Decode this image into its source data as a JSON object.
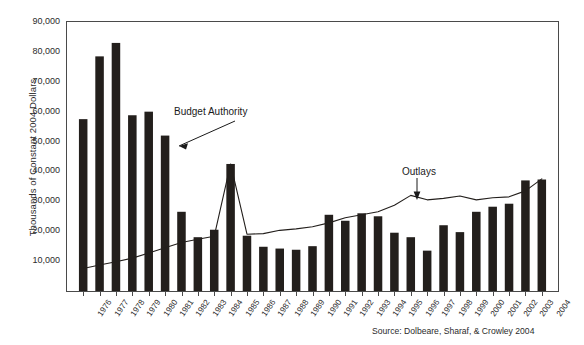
{
  "chart_data": {
    "type": "bar",
    "title": "",
    "subtitle": "",
    "xlabel": "",
    "ylabel": "Thousands of Constant 2004 Dollars",
    "ylim": [
      0,
      90000
    ],
    "ytick_labels": [
      "90,000",
      "80,000",
      "70,000",
      "60,000",
      "50,000",
      "40,000",
      "30,000",
      "20,000",
      "10,000"
    ],
    "ytick_values": [
      90000,
      80000,
      70000,
      60000,
      50000,
      40000,
      30000,
      20000,
      10000
    ],
    "grid": false,
    "legend_position": "none",
    "categories": [
      "1976",
      "1977",
      "1978",
      "1979",
      "1980",
      "1981",
      "1982",
      "1983",
      "1984",
      "1985",
      "1986",
      "1987",
      "1988",
      "1989",
      "1990",
      "1991",
      "1992",
      "1993",
      "1994",
      "1995",
      "1996",
      "1997",
      "1998",
      "1999",
      "2000",
      "2001",
      "2002",
      "2003",
      "2004"
    ],
    "series": [
      {
        "name": "Budget Authority",
        "type": "bar",
        "values": [
          57500,
          78500,
          83000,
          58800,
          60000,
          52000,
          26500,
          18000,
          20500,
          42500,
          18500,
          14800,
          14200,
          13800,
          15000,
          25500,
          23500,
          26000,
          25000,
          19500,
          18000,
          13500,
          22000,
          19700,
          26500,
          28200,
          29200,
          37000,
          37300
        ]
      },
      {
        "name": "Outlays",
        "type": "line",
        "values": [
          7500,
          8700,
          9800,
          11000,
          12700,
          14500,
          16200,
          17300,
          18300,
          42500,
          19000,
          19200,
          20300,
          20800,
          21500,
          22800,
          24500,
          25500,
          26500,
          28700,
          32000,
          30500,
          31000,
          31800,
          30500,
          31200,
          31500,
          33500,
          37500
        ]
      }
    ],
    "annotations": [
      {
        "text": "Budget Authority",
        "target_category": "1981"
      },
      {
        "text": "Outlays",
        "target_category": "1997"
      }
    ],
    "source": "Source: Dolbeare, Sharaf, & Crowley 2004"
  }
}
